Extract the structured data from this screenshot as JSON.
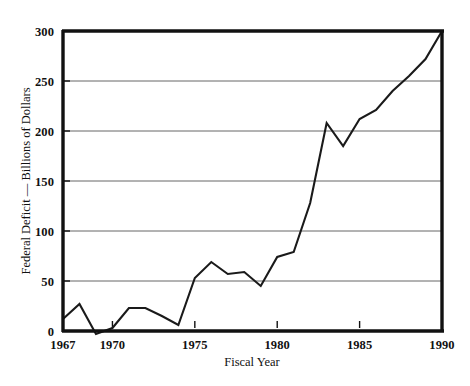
{
  "chart_data": {
    "type": "line",
    "title": "",
    "xlabel": "Fiscal Year",
    "ylabel": "Federal Deficit — Billions of Dollars",
    "xlim": [
      1967,
      1990
    ],
    "ylim": [
      0,
      300
    ],
    "grid": true,
    "legend": null,
    "xticks": [
      1967,
      1970,
      1975,
      1980,
      1985,
      1990
    ],
    "xtick_labels": [
      "1967",
      "1970",
      "1975",
      "1980",
      "1985",
      "1990"
    ],
    "yticks": [
      0,
      50,
      100,
      150,
      200,
      250,
      300
    ],
    "ytick_labels": [
      "0",
      "50",
      "100",
      "150",
      "200",
      "250",
      "300"
    ],
    "series": [
      {
        "name": "Federal Deficit",
        "x": [
          1967,
          1968,
          1969,
          1970,
          1971,
          1972,
          1973,
          1974,
          1975,
          1976,
          1977,
          1978,
          1979,
          1980,
          1981,
          1982,
          1983,
          1984,
          1985,
          1986,
          1987,
          1988,
          1989,
          1990
        ],
        "values": [
          12,
          27,
          -3,
          3,
          23,
          23,
          15,
          6,
          53,
          69,
          57,
          59,
          45,
          74,
          79,
          128,
          208,
          185,
          212,
          221,
          240,
          255,
          272,
          300
        ]
      }
    ]
  },
  "axes": {
    "y_axis_label": "Federal Deficit — Billions of Dollars",
    "x_axis_label": "Fiscal Year"
  },
  "ticks": {
    "y": [
      {
        "label": "300",
        "value": 300
      },
      {
        "label": "250",
        "value": 250
      },
      {
        "label": "200",
        "value": 200
      },
      {
        "label": "150",
        "value": 150
      },
      {
        "label": "100",
        "value": 100
      },
      {
        "label": "50",
        "value": 50
      },
      {
        "label": "0",
        "value": 0
      }
    ],
    "x": [
      {
        "label": "1967",
        "value": 1967
      },
      {
        "label": "1970",
        "value": 1970
      },
      {
        "label": "1975",
        "value": 1975
      },
      {
        "label": "1980",
        "value": 1980
      },
      {
        "label": "1985",
        "value": 1985
      },
      {
        "label": "1990",
        "value": 1990
      }
    ]
  },
  "colors": {
    "line": "#1a1a1a",
    "grid": "#555555",
    "frame": "#111111",
    "background": "#ffffff"
  }
}
